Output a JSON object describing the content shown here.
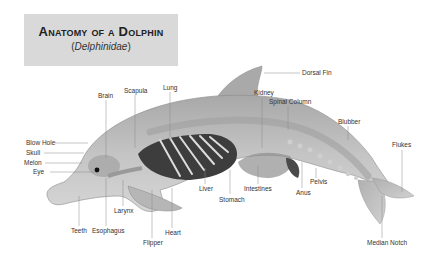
{
  "title": {
    "main": "Anatomy of a Dolphin",
    "sub_open": "(",
    "sub_italic": "Delphinidae",
    "sub_close": ")"
  },
  "labels": {
    "dorsal_fin": "Dorsal Fin",
    "brain": "Brain",
    "scapula": "Scapula",
    "lung": "Lung",
    "kidney": "Kidney",
    "spinal_column": "Spinal Column",
    "blubber": "Blubber",
    "flukes": "Flukes",
    "blow_hole": "Blow Hole",
    "skull": "Skull",
    "melon": "Melon",
    "eye": "Eye",
    "liver": "Liver",
    "stomach": "Stomach",
    "intestines": "Intestines",
    "anus": "Anus",
    "pelvis": "Pelvis",
    "larynx": "Larynx",
    "teeth": "Teeth",
    "esophagus": "Esophagus",
    "heart": "Heart",
    "flipper": "Flipper",
    "median_notch": "Median Notch"
  },
  "colors": {
    "title_bg": "#d9d9d9",
    "body": "#bdbdbd",
    "body_dark": "#9a9a9a",
    "organ_dark": "#3a3a3a",
    "leader": "#888888"
  }
}
